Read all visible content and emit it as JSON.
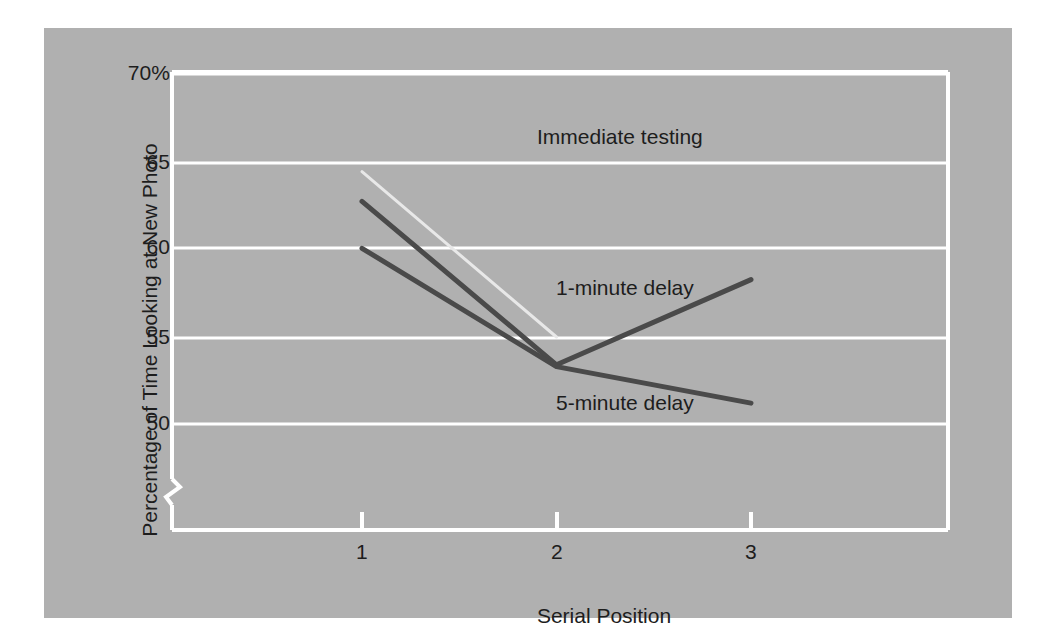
{
  "chart_data": {
    "type": "line",
    "title": "",
    "subtitle": "",
    "xlabel": "Serial Position",
    "ylabel": "Percentage of Time Looking at New Photo",
    "x": [
      1,
      2,
      3
    ],
    "xticklabels": [
      "1",
      "2",
      "3"
    ],
    "xlim": [
      0.35,
      3.65
    ],
    "yticks": [
      50,
      55,
      60,
      65,
      70
    ],
    "yticklabels": [
      "50",
      "55",
      "60",
      "65",
      "70%"
    ],
    "ylim": [
      47.3,
      70.0
    ],
    "y_axis_break": true,
    "grid": "horizontal",
    "legend": "inline-annotations",
    "series": [
      {
        "name": "Immediate testing",
        "label": "Immediate testing",
        "color": "#e8e8e8",
        "x": [
          1,
          2
        ],
        "values": [
          64.5,
          55.0
        ],
        "linewidth": 3
      },
      {
        "name": "1-minute delay",
        "label": "1-minute delay",
        "color": "#4a4a4a",
        "x": [
          1,
          2,
          3
        ],
        "values": [
          62.8,
          53.4,
          58.3
        ],
        "linewidth": 5
      },
      {
        "name": "5-minute delay",
        "label": "5-minute delay",
        "color": "#4a4a4a",
        "x": [
          1,
          2,
          3
        ],
        "values": [
          60.1,
          53.3,
          51.2
        ],
        "linewidth": 5
      }
    ],
    "annotations": [
      {
        "text": "Immediate testing",
        "x": 2.52,
        "y": 67.4
      },
      {
        "text": "1-minute delay",
        "x": 2.51,
        "y": 59.9
      },
      {
        "text": "5-minute delay",
        "x": 2.51,
        "y": 54.1
      }
    ],
    "colors": {
      "panel_background": "#b0b0b0",
      "axis_and_grid": "#ffffff",
      "text": "#1d1d1d",
      "dark_line": "#4a4a4a",
      "light_line": "#e8e8e8"
    }
  },
  "axis": {
    "y_title": "Percentage of Time Looking at New Photo",
    "x_title": "Serial Position",
    "y_ticks": [
      {
        "label": "70%"
      },
      {
        "label": "65"
      },
      {
        "label": "60"
      },
      {
        "label": "55"
      },
      {
        "label": "50"
      }
    ],
    "x_ticks": [
      {
        "label": "1"
      },
      {
        "label": "2"
      },
      {
        "label": "3"
      }
    ]
  },
  "labels": {
    "immediate": "Immediate testing",
    "one_minute": "1-minute delay",
    "five_minute": "5-minute delay"
  }
}
